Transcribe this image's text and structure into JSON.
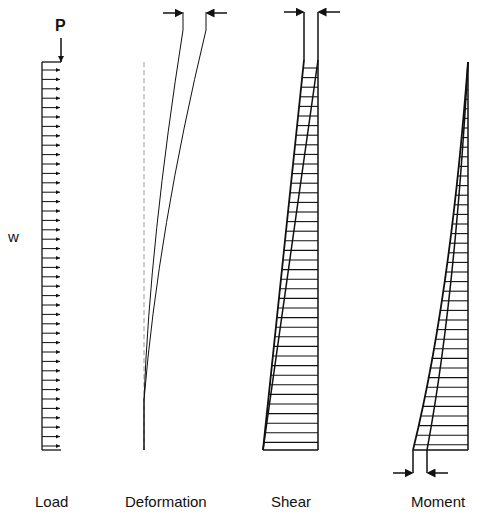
{
  "diagram": {
    "labels": {
      "load": "Load",
      "deformation": "Deformation",
      "shear": "Shear",
      "moment": "Moment",
      "point_load": "P",
      "distributed_load": "w"
    },
    "panels": [
      {
        "name": "Load",
        "description": "Uniform distributed load w with horizontal arrows and point load P at top"
      },
      {
        "name": "Deformation",
        "description": "Dashed undeformed axis with two deflected curves; arrows at top marking deflection"
      },
      {
        "name": "Shear",
        "description": "Trapezoidal shear diagram increasing linearly from top to base, hatched"
      },
      {
        "name": "Moment",
        "description": "Parabolic moment diagram from zero at top to maximum at base, hatched; arrows at base"
      }
    ],
    "colors": {
      "line": "#111111",
      "dashed_axis": "#999999",
      "background": "#ffffff"
    }
  }
}
